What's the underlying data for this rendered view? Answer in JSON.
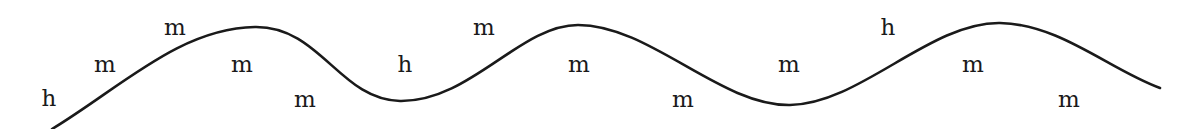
{
  "diagram": {
    "type": "pitch-contour",
    "stroke_color": "#1a1a1a",
    "background": "#ffffff",
    "contour_path": "M 52 129 C 120 88, 180 28, 255 27 C 320 26, 340 100, 400 101 C 470 102, 520 25, 578 25 C 650 25, 720 106, 790 105 C 860 104, 930 22, 1000 23 C 1060 24, 1110 70, 1160 88",
    "labels": [
      {
        "text": "h",
        "x": 49,
        "y": 106
      },
      {
        "text": "m",
        "x": 105,
        "y": 72
      },
      {
        "text": "m",
        "x": 175,
        "y": 35
      },
      {
        "text": "m",
        "x": 242,
        "y": 72
      },
      {
        "text": "m",
        "x": 305,
        "y": 107
      },
      {
        "text": "h",
        "x": 405,
        "y": 72
      },
      {
        "text": "m",
        "x": 484,
        "y": 35
      },
      {
        "text": "m",
        "x": 579,
        "y": 72
      },
      {
        "text": "m",
        "x": 683,
        "y": 107
      },
      {
        "text": "m",
        "x": 789,
        "y": 72
      },
      {
        "text": "h",
        "x": 888,
        "y": 35
      },
      {
        "text": "m",
        "x": 973,
        "y": 72
      },
      {
        "text": "m",
        "x": 1069,
        "y": 107
      }
    ]
  }
}
